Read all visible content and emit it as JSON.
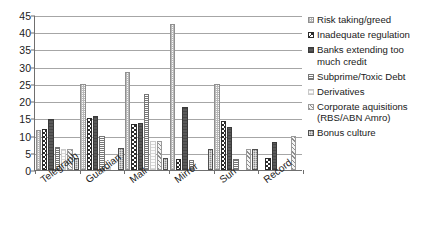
{
  "chart_data": {
    "type": "bar",
    "title": "",
    "subtitle": "",
    "xlabel": "",
    "ylabel": "",
    "categories": [
      "Telegraph",
      "Guardian",
      "Mail",
      "Mirror",
      "Sun",
      "Record"
    ],
    "ylim": [
      0,
      45
    ],
    "ytick_labels": [
      "0",
      "5",
      "10",
      "15",
      "20",
      "25",
      "30",
      "35",
      "40",
      "45"
    ],
    "ytick_values": [
      0,
      5,
      10,
      15,
      20,
      25,
      30,
      35,
      40,
      45
    ],
    "grid": true,
    "legend_position": "right",
    "series": [
      {
        "name": "Risk taking/greed",
        "marker": "risk-taking-greed-swatch",
        "values": [
          11.5,
          25.0,
          28.6,
          42.5,
          25.0,
          0.0
        ]
      },
      {
        "name": "Inadequate regulation",
        "marker": "inadequate-regulation-swatch",
        "values": [
          12.0,
          15.0,
          13.4,
          3.3,
          14.3,
          3.4
        ]
      },
      {
        "name": "Banks extending too\nmuch credit",
        "marker": "banks-extending-credit-swatch",
        "values": [
          14.8,
          15.6,
          13.6,
          18.2,
          12.5,
          8.0
        ]
      },
      {
        "name": "Subprime/Toxic Debt",
        "marker": "subprime-toxic-debt-swatch",
        "values": [
          6.7,
          10.0,
          22.0,
          2.9,
          3.3,
          0.0
        ]
      },
      {
        "name": "Derivatives",
        "marker": "derivatives-swatch",
        "values": [
          6.0,
          1.0,
          8.3,
          0.0,
          0.0,
          0.0
        ]
      },
      {
        "name": "Corporate aquisitions\n(RBS/ABN Amro)",
        "marker": "corporate-aquisitions-swatch",
        "values": [
          6.2,
          0.0,
          8.3,
          0.0,
          6.0,
          10.0
        ]
      },
      {
        "name": "Bonus culture",
        "marker": "bonus-culture-swatch",
        "values": [
          3.4,
          6.5,
          3.4,
          6.0,
          6.0,
          0.0
        ]
      }
    ]
  },
  "legend": {
    "items": [
      {
        "label": "Risk taking/greed"
      },
      {
        "label": "Inadequate regulation"
      },
      {
        "label": "Banks extending too\nmuch credit"
      },
      {
        "label": "Subprime/Toxic Debt"
      },
      {
        "label": "Derivatives"
      },
      {
        "label": "Corporate aquisitions\n(RBS/ABN Amro)"
      },
      {
        "label": "Bonus culture"
      }
    ]
  },
  "colors": {
    "axis": "#6f6f6f",
    "grid": "#a6a6a6",
    "text": "#1a1a1a",
    "background": "#ffffff"
  }
}
